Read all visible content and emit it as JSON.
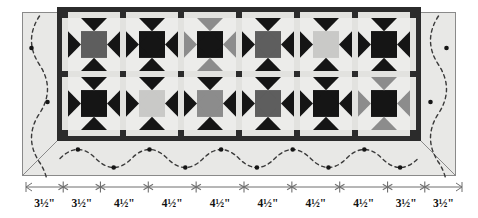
{
  "diagram": {
    "type": "quilt-layout-diagram"
  },
  "palette": {
    "background": "#ffffff",
    "border_fabric": "#e8e8e6",
    "outer_outline": "#8a8a8a",
    "inner_border_dark": "#2b2b2b",
    "sashing_light": "#e2e2df",
    "block_background": "#ececea",
    "black": "#151515",
    "dark_gray": "#5e5e5e",
    "medium_gray": "#8c8c8c",
    "light_gray": "#c9c9c7",
    "quilting_line": "#3a3a3a",
    "ruler_line": "#6f6f6f",
    "text": "#111111"
  },
  "quilt": {
    "outer_frame": {
      "x": 22,
      "y": 12,
      "width": 434,
      "height": 164
    },
    "center_panel": {
      "x": 62,
      "y": 12,
      "width": 354,
      "height": 124
    },
    "inner_border_width": 5,
    "rows": 2,
    "columns": 6,
    "sashing_width": 6,
    "block_size": 48,
    "blocks": [
      {
        "row": 1,
        "col": 1,
        "star_color": "dark_gray",
        "center_color": "dark_gray",
        "point_color": "black",
        "label": "star-block-r1c1"
      },
      {
        "row": 1,
        "col": 2,
        "star_color": "black",
        "center_color": "black",
        "point_color": "black",
        "label": "star-block-r1c2"
      },
      {
        "row": 1,
        "col": 3,
        "star_color": "black",
        "center_color": "black",
        "point_color": "medium_gray",
        "label": "star-block-r1c3"
      },
      {
        "row": 1,
        "col": 4,
        "star_color": "dark_gray",
        "center_color": "dark_gray",
        "point_color": "black",
        "label": "star-block-r1c4"
      },
      {
        "row": 1,
        "col": 5,
        "star_color": "light_gray",
        "center_color": "light_gray",
        "point_color": "black",
        "label": "star-block-r1c5"
      },
      {
        "row": 1,
        "col": 6,
        "star_color": "black",
        "center_color": "black",
        "point_color": "black",
        "label": "star-block-r1c6"
      },
      {
        "row": 2,
        "col": 1,
        "star_color": "black",
        "center_color": "black",
        "point_color": "black",
        "label": "star-block-r2c1"
      },
      {
        "row": 2,
        "col": 2,
        "star_color": "light_gray",
        "center_color": "light_gray",
        "point_color": "black",
        "label": "star-block-r2c2"
      },
      {
        "row": 2,
        "col": 3,
        "star_color": "medium_gray",
        "center_color": "medium_gray",
        "point_color": "black",
        "label": "star-block-r2c3"
      },
      {
        "row": 2,
        "col": 4,
        "star_color": "dark_gray",
        "center_color": "dark_gray",
        "point_color": "black",
        "label": "star-block-r2c4"
      },
      {
        "row": 2,
        "col": 5,
        "star_color": "black",
        "center_color": "black",
        "point_color": "black",
        "label": "star-block-r2c5"
      },
      {
        "row": 2,
        "col": 6,
        "star_color": "black",
        "center_color": "black",
        "point_color": "medium_gray",
        "label": "star-block-r2c6"
      }
    ],
    "quilting_motif": {
      "name": "serpentine-wave-with-dots",
      "waves_bottom": 5,
      "waves_top": 5,
      "waves_side": 1,
      "dot_color": "#151515"
    }
  },
  "ruler": {
    "label": "segment-measurements",
    "unit": "inch",
    "start_cap": "arrow",
    "end_cap": "arrow",
    "tick_glyph": "asterisk",
    "segments": [
      {
        "index": 1,
        "label": "3½\"",
        "value": 3.5
      },
      {
        "index": 2,
        "label": "3½\"",
        "value": 3.5
      },
      {
        "index": 3,
        "label": "4½\"",
        "value": 4.5
      },
      {
        "index": 4,
        "label": "4½\"",
        "value": 4.5
      },
      {
        "index": 5,
        "label": "4½\"",
        "value": 4.5
      },
      {
        "index": 6,
        "label": "4½\"",
        "value": 4.5
      },
      {
        "index": 7,
        "label": "4½\"",
        "value": 4.5
      },
      {
        "index": 8,
        "label": "4½\"",
        "value": 4.5
      },
      {
        "index": 9,
        "label": "3½\"",
        "value": 3.5
      },
      {
        "index": 10,
        "label": "3½\"",
        "value": 3.5
      }
    ]
  }
}
